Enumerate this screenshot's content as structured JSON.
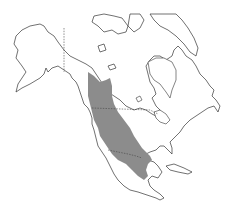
{
  "map": {
    "type": "species-range-map",
    "region": "North America",
    "background_color": "#ffffff",
    "land_fill": "#ffffff",
    "outline_color": "#333333",
    "range_color": "#8c8c8c",
    "borders": [
      "Alaska-Canada",
      "Canada-United States",
      "United States-Mexico"
    ],
    "range_description": "Western North America from northern British Columbia south through the western United States into Mexico"
  }
}
